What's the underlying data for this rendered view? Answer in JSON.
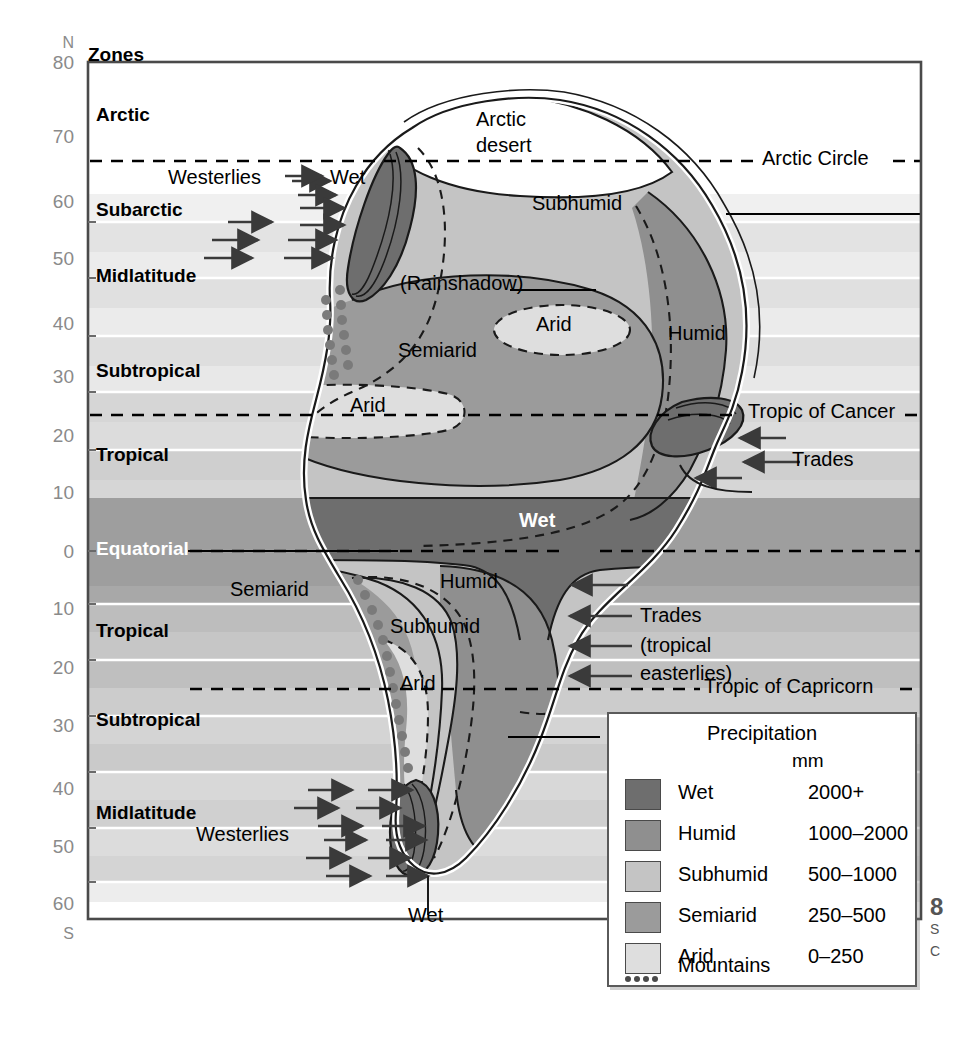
{
  "figure": {
    "type": "diagram",
    "axis": {
      "top_hemisphere": "N",
      "bottom_hemisphere": "S",
      "ticks_north": [
        "80",
        "70",
        "60",
        "50",
        "40",
        "30",
        "20",
        "10"
      ],
      "equator_tick": "0",
      "ticks_south": [
        "10",
        "20",
        "30",
        "40",
        "50",
        "60"
      ],
      "zones_header": "Zones"
    },
    "zones_north": [
      {
        "name": "Arctic",
        "top": 0.0,
        "bottom": 0.148
      },
      {
        "name": "Subarctic",
        "top": 0.148,
        "bottom": 0.262
      },
      {
        "name": "Midlatitude",
        "top": 0.262,
        "bottom": 0.382
      },
      {
        "name": "Subtropical",
        "top": 0.382,
        "bottom": 0.468
      },
      {
        "name": "Tropical",
        "top": 0.468,
        "bottom": 0.552
      },
      {
        "name": "Equatorial",
        "top": 0.552,
        "bottom": 0.638
      }
    ],
    "zones_south": [
      {
        "name": "Tropical",
        "top": 0.638,
        "bottom": 0.724
      },
      {
        "name": "Subtropical",
        "top": 0.724,
        "bottom": 0.812
      },
      {
        "name": "Midlatitude",
        "top": 0.812,
        "bottom": 0.938
      }
    ],
    "latitude_lines": [
      {
        "label": "Arctic Circle",
        "lat": 66.5,
        "hemisphere": "N"
      },
      {
        "label": "Tropic of Cancer",
        "lat": 23.5,
        "hemisphere": "N"
      },
      {
        "label": "Tropic of Capricorn",
        "lat": 23.5,
        "hemisphere": "S"
      }
    ],
    "map_labels": [
      {
        "text": "Arctic desert",
        "kind": "region"
      },
      {
        "text": "Subhumid",
        "kind": "region"
      },
      {
        "text": "Humid",
        "kind": "region"
      },
      {
        "text": "(Rainshadow)",
        "kind": "annotation"
      },
      {
        "text": "Semiarid",
        "kind": "region"
      },
      {
        "text": "Arid",
        "kind": "region"
      },
      {
        "text": "Wet",
        "kind": "region"
      }
    ],
    "wind_labels": [
      {
        "text": "Westerlies",
        "hemisphere": "N",
        "direction": "eastward"
      },
      {
        "text": "Trades",
        "hemisphere": "N",
        "direction": "westward"
      },
      {
        "text": "Trades",
        "hemisphere": "S",
        "direction": "westward"
      },
      {
        "text": "(tropical easterlies)",
        "hemisphere": "S"
      },
      {
        "text": "Westerlies",
        "hemisphere": "S",
        "direction": "eastward"
      }
    ],
    "callouts": [
      {
        "text": "Wet",
        "note": "north-west coast orographic belt"
      },
      {
        "text": "Wet",
        "note": "south-west coast orographic belt"
      }
    ]
  },
  "labels": {
    "arctic_desert_l1": "Arctic",
    "arctic_desert_l2": "desert",
    "subhumid_n": "Subhumid",
    "humid_ne": "Humid",
    "rainshadow": "(Rainshadow)",
    "semiarid_n": "Semiarid",
    "arid_n_upper": "Arid",
    "arid_n_lower": "Arid",
    "wet_equator": "Wet",
    "humid_s": "Humid",
    "subhumid_s": "Subhumid",
    "semiarid_s": "Semiarid",
    "arid_s": "Arid",
    "wet_nw": "Wet",
    "wet_sw": "Wet",
    "westerlies_n": "Westerlies",
    "westerlies_s": "Westerlies",
    "trades_n": "Trades",
    "trades_s": "Trades",
    "trades_s_sub": "(tropical easterlies)",
    "arctic_circle": "Arctic Circle",
    "tropic_cancer": "Tropic of Cancer",
    "tropic_capricorn": "Tropic of Capricorn"
  },
  "legend": {
    "title": "Precipitation",
    "unit": "mm",
    "items": [
      {
        "name": "Wet",
        "range": "2000+",
        "color": "#6e6e6e"
      },
      {
        "name": "Humid",
        "range": "1000–2000",
        "color": "#8f8f8f"
      },
      {
        "name": "Subhumid",
        "range": "500–1000",
        "color": "#c4c4c4"
      },
      {
        "name": "Semiarid",
        "range": "250–500",
        "color": "#9b9b9b"
      },
      {
        "name": "Arid",
        "range": "0–250",
        "color": "#dedede"
      }
    ],
    "mountains_label": "Mountains"
  },
  "caption": {
    "number": "8",
    "line1": "S",
    "line2": "C"
  },
  "colors": {
    "wet": "#6e6e6e",
    "humid": "#8f8f8f",
    "subhumid": "#c4c4c4",
    "semiarid": "#9b9b9b",
    "arid": "#dedede",
    "ocean_light": "#f2f2f2",
    "frame": "#4a4a4a",
    "tick_text": "#8a8a8a",
    "coast_white": "#ffffff",
    "mountain_dot": "#7a7a7a"
  }
}
